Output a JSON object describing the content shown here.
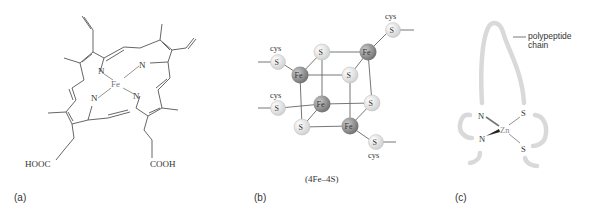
{
  "panels": [
    {
      "id": "a",
      "label": "(a)",
      "title": "heme",
      "atoms": {
        "metal": "Fe",
        "nitrogen": "N",
        "left_acid": "HOOC",
        "right_acid": "COOH"
      }
    },
    {
      "id": "b",
      "label": "(b)",
      "caption": "(4Fe–4S)",
      "atoms": {
        "iron": "Fe",
        "sulfur": "S",
        "ligand": "cys"
      }
    },
    {
      "id": "c",
      "label": "(c)",
      "annotation_line1": "polypeptide",
      "annotation_line2": "chain",
      "atoms": {
        "metal": "Zn",
        "nitrogen": "N",
        "sulfur": "S"
      }
    }
  ],
  "colors": {
    "line": "#555555",
    "iron_sphere": "#8a8a8a",
    "sulfur_sphere": "#e4e4e4",
    "chain": "#d9d9d9"
  }
}
